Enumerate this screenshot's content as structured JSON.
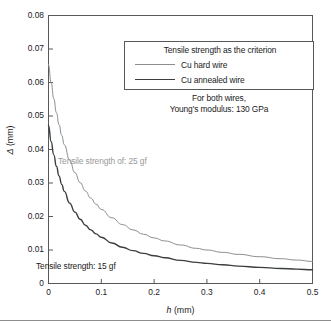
{
  "chart_data": {
    "type": "line",
    "title": "",
    "xlabel": "h (mm)",
    "ylabel": "Δ (mm)",
    "xlim": [
      0,
      0.5
    ],
    "ylim": [
      0,
      0.08
    ],
    "grid": false,
    "xticks": [
      "0",
      "0.1",
      "0.2",
      "0.3",
      "0.4",
      "0.5"
    ],
    "xtick_values": [
      0,
      0.1,
      0.2,
      0.3,
      0.4,
      0.5
    ],
    "yticks": [
      "0",
      "0.01",
      "0.02",
      "0.03",
      "0.04",
      "0.05",
      "0.06",
      "0.07",
      "0.08"
    ],
    "ytick_values": [
      0,
      0.01,
      0.02,
      0.03,
      0.04,
      0.05,
      0.06,
      0.07,
      0.08
    ],
    "legend_position": "upper-center-inside",
    "legend_title": "Tensile strength as the criterion",
    "annotations": [
      {
        "text": "Tensile strength of: 25 gf",
        "x": 0.07,
        "y": 0.0345,
        "color": "#97999b"
      },
      {
        "text": "Tensile strength: 15 gf",
        "x": 0.015,
        "y": 0.0065,
        "color": "#1a1a1a"
      },
      {
        "text": "For both wires,",
        "x": 0.25,
        "y": 0.0745,
        "color": "#1a1a1a"
      },
      {
        "text": "Young's modulus: 130 GPa",
        "x": 0.25,
        "y": 0.0715,
        "color": "#1a1a1a"
      }
    ],
    "series": [
      {
        "name": "Cu hard wire",
        "color": "#8a8e91",
        "width": 1,
        "tensile_strength_gf": 25,
        "x": [
          0.0,
          0.005,
          0.01,
          0.015,
          0.02,
          0.025,
          0.03,
          0.04,
          0.05,
          0.06,
          0.07,
          0.08,
          0.09,
          0.1,
          0.12,
          0.14,
          0.16,
          0.18,
          0.2,
          0.22,
          0.25,
          0.28,
          0.3,
          0.33,
          0.36,
          0.4,
          0.44,
          0.47,
          0.5
        ],
        "values": [
          0.0655,
          0.06,
          0.0552,
          0.051,
          0.0474,
          0.0442,
          0.0414,
          0.0368,
          0.0331,
          0.0301,
          0.0276,
          0.0255,
          0.0237,
          0.0221,
          0.0196,
          0.0176,
          0.016,
          0.0147,
          0.0136,
          0.0127,
          0.0115,
          0.0105,
          0.01,
          0.0093,
          0.0087,
          0.008,
          0.0074,
          0.007,
          0.0066
        ]
      },
      {
        "name": "Cu annealed wire",
        "color": "#3a3e41",
        "width": 1.4,
        "tensile_strength_gf": 15,
        "x": [
          0.0,
          0.005,
          0.01,
          0.015,
          0.02,
          0.025,
          0.03,
          0.04,
          0.05,
          0.06,
          0.07,
          0.08,
          0.09,
          0.1,
          0.12,
          0.14,
          0.16,
          0.18,
          0.2,
          0.22,
          0.25,
          0.28,
          0.3,
          0.33,
          0.36,
          0.4,
          0.44,
          0.47,
          0.5
        ],
        "values": [
          0.0472,
          0.0424,
          0.0384,
          0.035,
          0.0321,
          0.0296,
          0.0275,
          0.024,
          0.0213,
          0.0192,
          0.0174,
          0.016,
          0.0148,
          0.0138,
          0.0121,
          0.0108,
          0.0098,
          0.009,
          0.0083,
          0.0077,
          0.0069,
          0.0063,
          0.006,
          0.0056,
          0.0052,
          0.0048,
          0.0045,
          0.0043,
          0.0041
        ]
      }
    ],
    "notes": {
      "line1": "For both wires,",
      "line2": "Young's modulus: 130 GPa",
      "youngs_modulus_GPa": 130
    }
  },
  "axis": {
    "ylabel_symbol": "Δ",
    "ylabel_unit": "(mm)",
    "xlabel_symbol": "h",
    "xlabel_unit": "(mm)"
  }
}
